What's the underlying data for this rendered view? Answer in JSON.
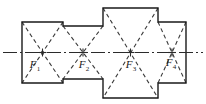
{
  "figure": {
    "background_color": "#ffffff",
    "outline_color": "#1a1a1a",
    "hidden_line_color": "#3a3a3a",
    "centerline_color": "#2b2b2b",
    "outline_width": 1.4,
    "hidden_width": 1.1,
    "centerline_width": 1.1,
    "hidden_dash": "4,3",
    "centerline_dash": "14,3,2,3",
    "outline_path": "M22,22 L63,22 L63,26 L103,26 L103,8 L158,8 L158,22 L186,22 L186,83 L158,83 L158,98 L103,98 L103,79 L63,79 L63,83 L22,83 Z",
    "centerline": {
      "x1": 3,
      "y1": 52.5,
      "x2": 203,
      "y2": 52.5
    }
  },
  "sections": [
    {
      "id": "section-f1",
      "label": "F",
      "subscript": "1",
      "rect": {
        "x": 22,
        "y": 22,
        "width": 41,
        "height": 61
      },
      "label_x": 35,
      "label_y": 68,
      "diagonals": [
        {
          "x1": 22,
          "y1": 22,
          "x2": 63,
          "y2": 83
        },
        {
          "x1": 63,
          "y1": 22,
          "x2": 22,
          "y2": 83
        }
      ]
    },
    {
      "id": "section-f2",
      "label": "F",
      "subscript": "2",
      "rect": {
        "x": 63,
        "y": 26,
        "width": 40,
        "height": 53
      },
      "label_x": 84,
      "label_y": 68,
      "diagonals": [
        {
          "x1": 63,
          "y1": 26,
          "x2": 103,
          "y2": 79
        },
        {
          "x1": 103,
          "y1": 26,
          "x2": 63,
          "y2": 79
        }
      ]
    },
    {
      "id": "section-f3",
      "label": "F",
      "subscript": "3",
      "rect": {
        "x": 103,
        "y": 8,
        "width": 55,
        "height": 90
      },
      "label_x": 131,
      "label_y": 68,
      "diagonals": [
        {
          "x1": 103,
          "y1": 8,
          "x2": 158,
          "y2": 98
        },
        {
          "x1": 158,
          "y1": 8,
          "x2": 103,
          "y2": 98
        }
      ]
    },
    {
      "id": "section-f4",
      "label": "F",
      "subscript": "4",
      "rect": {
        "x": 158,
        "y": 22,
        "width": 28,
        "height": 61
      },
      "label_x": 171,
      "label_y": 66,
      "diagonals": [
        {
          "x1": 158,
          "y1": 22,
          "x2": 186,
          "y2": 83
        },
        {
          "x1": 186,
          "y1": 22,
          "x2": 158,
          "y2": 83
        }
      ]
    }
  ],
  "center_marks": [
    {
      "id": "center-mark-f1",
      "cx": 42.5,
      "cy": 52.5
    },
    {
      "id": "center-mark-f2",
      "cx": 83,
      "cy": 52.5
    },
    {
      "id": "center-mark-f3",
      "cx": 130.5,
      "cy": 52.5
    },
    {
      "id": "center-mark-f4",
      "cx": 172,
      "cy": 52.5
    }
  ]
}
